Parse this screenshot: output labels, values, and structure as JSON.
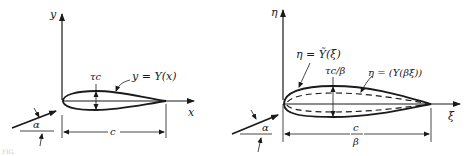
{
  "left_panel": {
    "axis_y_label": "y",
    "axis_x_label": "x",
    "thickness_label": "τc",
    "curve_label": "y = Y(x)",
    "chord_label": "c",
    "angle_label": "α"
  },
  "right_panel": {
    "axis_y_label": "η",
    "axis_x_label": "ξ",
    "outer_curve_label": "η = Ỹ(ξ)",
    "thickness_label": "τc/β",
    "inner_curve_label": "η = (Y(βξ))",
    "chord_label_num": "c",
    "chord_label_den": "β",
    "angle_label": "α"
  },
  "caption": "FIG."
}
